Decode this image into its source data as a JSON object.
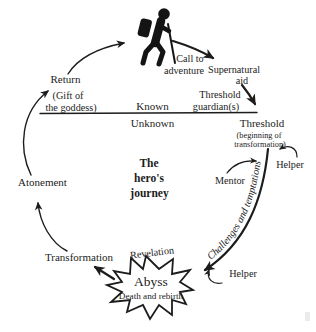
{
  "diagram": {
    "title": {
      "line1": "The",
      "line2": "hero's",
      "line3": "journey"
    },
    "labels": {
      "return": "Return",
      "gift_1": "(Gift of",
      "gift_2": "the goddess)",
      "known": "Known",
      "unknown": "Unknown",
      "call_1": "Call to",
      "call_2": "adventure",
      "aid_1": "Supernatural",
      "aid_2": "aid",
      "guardian_1": "Threshold",
      "guardian_2": "guardian(s)",
      "threshold": "Threshold",
      "threshold_sub1": "(beginning of",
      "threshold_sub2": "transformation)",
      "helper_top": "Helper",
      "mentor": "Mentor",
      "challenges": "Challenges and temptations",
      "helper_bottom": "Helper",
      "revelation": "Revelation",
      "abyss": "Abyss",
      "abyss_sub": "Death and rebirth",
      "transformation": "Transformation",
      "atonement": "Atonement"
    },
    "icons": {
      "hiker": "hiker-icon"
    },
    "colors": {
      "ink": "#1c1c1c",
      "background": "#ffffff"
    }
  }
}
